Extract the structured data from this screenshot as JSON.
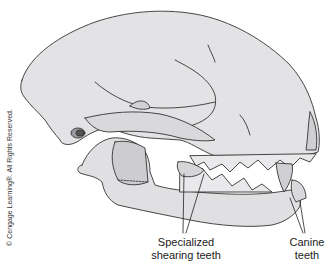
{
  "figure": {
    "colors": {
      "bone_fill": "#e3e3e5",
      "bone_shadow": "#c9c9cc",
      "outline": "#333333",
      "background": "#ffffff"
    }
  },
  "labels": {
    "shearing_teeth": "Specialized\nshearing teeth",
    "canine_teeth": "Canine\nteeth"
  },
  "copyright": "© Cengage Learning®. All Rights Reserved."
}
